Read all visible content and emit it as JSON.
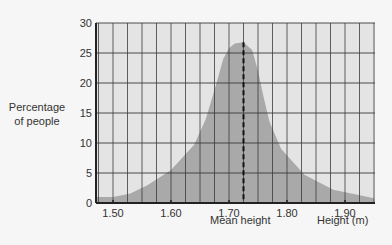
{
  "chart_data": {
    "type": "area",
    "title": "",
    "xlabel": "Height (m)",
    "ylabel": "Percentage of people",
    "ylabel_lines": [
      "Percentage",
      "of people"
    ],
    "xlim": [
      1.47,
      1.95
    ],
    "ylim": [
      0,
      30
    ],
    "x_ticks": [
      "1.50",
      "1.60",
      "1.70",
      "1.80",
      "1.90"
    ],
    "y_ticks": [
      "0",
      "5",
      "10",
      "15",
      "20",
      "25",
      "30"
    ],
    "grid": true,
    "annotation": {
      "label": "Mean height",
      "x": 1.725,
      "style": "dashed vertical line"
    },
    "series": [
      {
        "name": "Height distribution",
        "x": [
          1.47,
          1.5,
          1.53,
          1.56,
          1.6,
          1.64,
          1.66,
          1.67,
          1.68,
          1.69,
          1.7,
          1.71,
          1.725,
          1.74,
          1.75,
          1.76,
          1.77,
          1.79,
          1.83,
          1.88,
          1.95
        ],
        "values": [
          1.0,
          1.0,
          1.6,
          3.0,
          5.5,
          9.7,
          14.0,
          17.2,
          20.5,
          24.0,
          25.8,
          26.6,
          26.8,
          25.5,
          22.0,
          17.5,
          13.5,
          9.0,
          4.7,
          2.2,
          0.8
        ]
      }
    ],
    "colors": {
      "plot_bg": "#e4e4e4",
      "fill": "#a9a9a9",
      "grid": "#3a3a3a"
    }
  }
}
